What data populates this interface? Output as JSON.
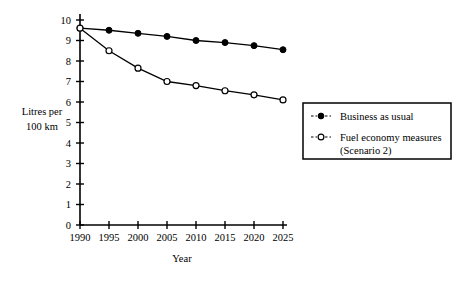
{
  "chart_data": {
    "type": "line",
    "title": "",
    "xlabel": "Year",
    "ylabel": "Litres per 100 km",
    "ylabel_line1": "Litres per",
    "ylabel_line2": "100 km",
    "categories": [
      "1990",
      "1995",
      "2000",
      "2005",
      "2010",
      "2015",
      "2020",
      "2025"
    ],
    "x": [
      1990,
      1995,
      2000,
      2005,
      2010,
      2015,
      2020,
      2025
    ],
    "xlim": [
      1990,
      2025
    ],
    "ylim": [
      0,
      10
    ],
    "yticks": [
      "0",
      "1",
      "2",
      "3",
      "4",
      "5",
      "6",
      "7",
      "8",
      "9",
      "10"
    ],
    "ytick_values": [
      0,
      1,
      2,
      3,
      4,
      5,
      6,
      7,
      8,
      9,
      10
    ],
    "grid": false,
    "legend_position": "right",
    "series": [
      {
        "name": "Business as usual",
        "marker": "filled-circle",
        "values": [
          9.6,
          9.5,
          9.35,
          9.2,
          9.0,
          8.9,
          8.75,
          8.55
        ]
      },
      {
        "name": "Fuel economy measures (Scenario 2)",
        "marker": "open-circle",
        "values": [
          9.6,
          8.5,
          7.65,
          7.0,
          6.8,
          6.55,
          6.35,
          6.1
        ]
      }
    ]
  },
  "legend": {
    "entries": [
      {
        "label_line1": "Business as usual",
        "label_line2": "",
        "marker": "filled-circle"
      },
      {
        "label_line1": "Fuel economy measures",
        "label_line2": "(Scenario 2)",
        "marker": "open-circle"
      }
    ]
  },
  "colors": {
    "ink": "#000000",
    "background": "#ffffff"
  }
}
